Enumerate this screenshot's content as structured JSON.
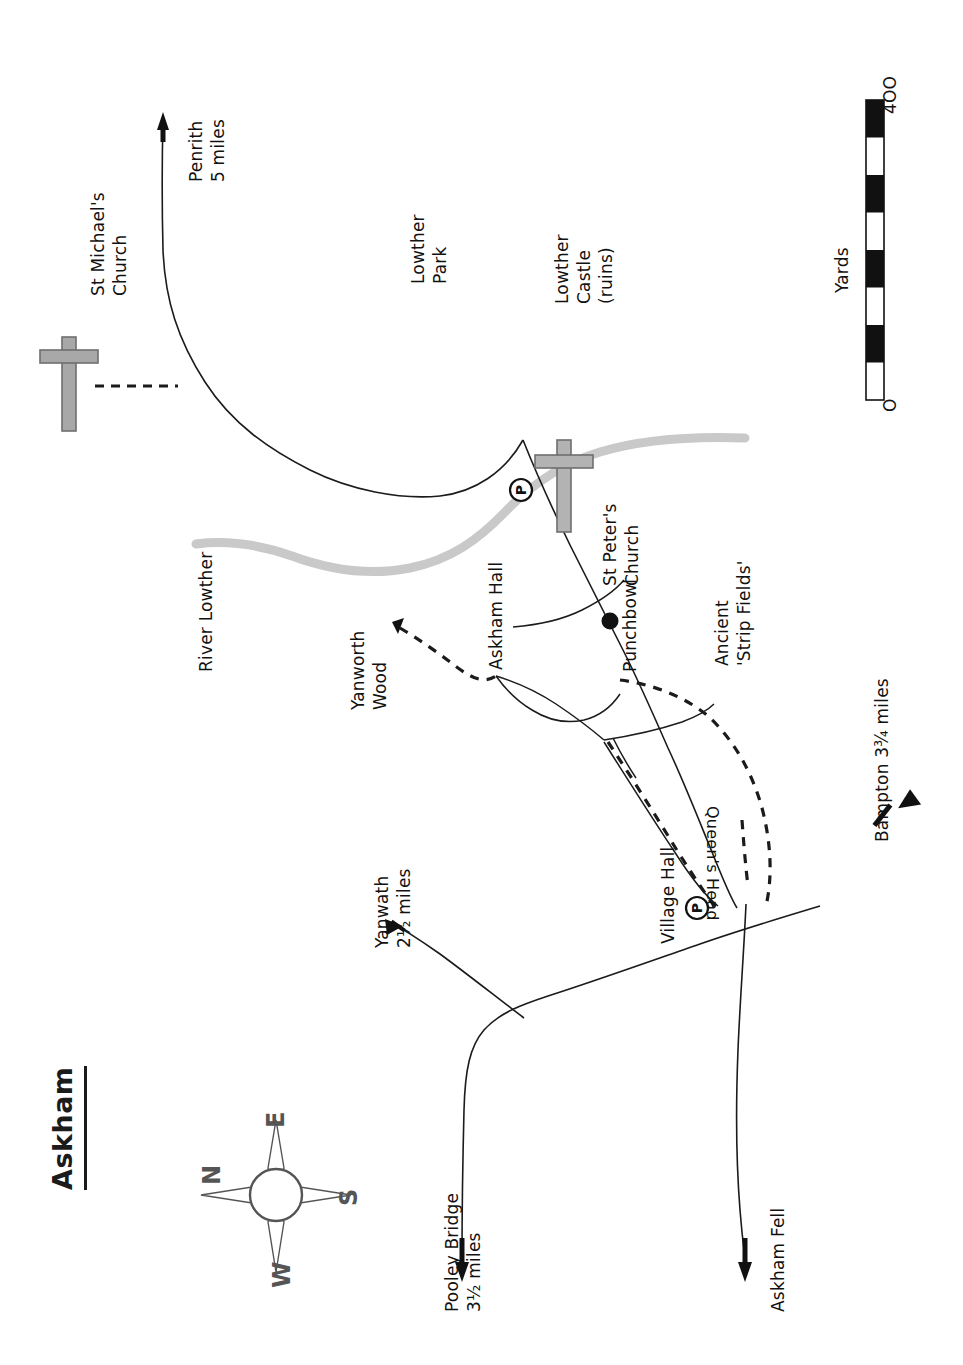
{
  "map": {
    "title": "Askham",
    "scalebar": {
      "unit_label": "Yards",
      "min_label": "O",
      "max_label": "4OO",
      "segments": 8
    },
    "compass": {
      "north": "N",
      "east": "E",
      "south": "S",
      "west": "W"
    },
    "colors": {
      "ink": "#111111",
      "river": "#c9c9c9",
      "church_symbol": "#9a9a9a",
      "paper": "#ffffff"
    },
    "places": [
      {
        "id": "st-michaels-church",
        "label": "St Michael's\nChurch"
      },
      {
        "id": "lowther-park",
        "label": "Lowther\nPark"
      },
      {
        "id": "lowther-castle",
        "label": "Lowther\nCastle\n(ruins)"
      },
      {
        "id": "river-lowther",
        "label": "River Lowther"
      },
      {
        "id": "st-peters-church",
        "label": "St Peter's\nChurch"
      },
      {
        "id": "yanworth-wood",
        "label": "Yanworth\nWood"
      },
      {
        "id": "askham-hall",
        "label": "Askham Hall"
      },
      {
        "id": "punchbowl",
        "label": "Punchbowl"
      },
      {
        "id": "ancient-strip-fields",
        "label": "Ancient\n'Strip Fields'"
      },
      {
        "id": "village-hall",
        "label": "Village Hall"
      },
      {
        "id": "queens-head",
        "label": "Queen's Head"
      }
    ],
    "destinations": [
      {
        "id": "penrith",
        "label": "Penrith\n5 miles"
      },
      {
        "id": "yanwath",
        "label": "Yanwath\n2½ miles"
      },
      {
        "id": "pooley-bridge",
        "label": "Pooley Bridge\n3½ miles"
      },
      {
        "id": "askham-fell",
        "label": "Askham Fell"
      },
      {
        "id": "bampton",
        "label": "Bampton 3¾ miles"
      }
    ],
    "symbols": [
      {
        "id": "parking-st-peters",
        "label": "P"
      },
      {
        "id": "parking-village-hall",
        "label": "P"
      }
    ]
  }
}
